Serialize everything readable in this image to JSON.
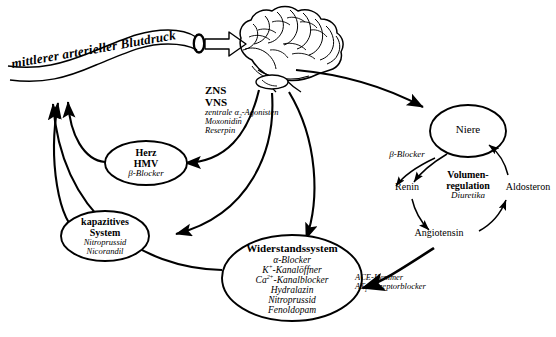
{
  "diagram": {
    "language": "de",
    "background_color": "#ffffff",
    "line_color": "#000000"
  },
  "vessel": {
    "label": "mittlerer arterieller Blutdruck",
    "arrow_name": "block-arrow-to-brain"
  },
  "brain": {
    "name": "brain-illustration",
    "caption_line1": "ZNS",
    "caption_line2": "VNS",
    "drugs": [
      "zentrale α₂-Agonisten",
      "Moxonidin",
      "Reserpin"
    ]
  },
  "nodes": {
    "herz": {
      "line1": "Herz",
      "line2": "HMV",
      "drugs": [
        "β-Blocker"
      ]
    },
    "kapazitives": {
      "line1": "kapazitives",
      "line2": "System",
      "drugs": [
        "Nitroprussid",
        "Nicorandil"
      ]
    },
    "widerstand": {
      "line1": "Widerstandssystem",
      "drugs": [
        "α-Blocker",
        "K⁺-Kanalöffner",
        "Ca²⁺-Kanalblocker",
        "Hydralazin",
        "Nitroprussid",
        "Fenoldopam"
      ]
    },
    "niere": {
      "line1": "Niere"
    },
    "volumen": {
      "line1": "Volumen-",
      "line2": "regulation",
      "drugs": [
        "Diuretika"
      ]
    }
  },
  "cycle": {
    "renin": "Renin",
    "angiotensin": "Angiotensin",
    "aldosteron": "Aldosteron"
  },
  "labels": {
    "beta_blocker_niere": "β-Blocker",
    "ace_line1": "ACE-Hemmer",
    "ace_line2": "AT₁-Rezeptorblocker"
  }
}
